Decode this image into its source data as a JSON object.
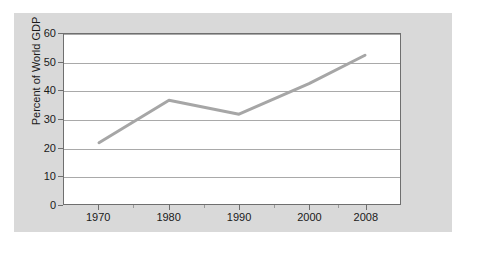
{
  "chart_data": {
    "type": "line",
    "title": "",
    "xlabel": "",
    "ylabel": "Percent of World GDP",
    "x": [
      1970,
      1980,
      1990,
      2000,
      2008
    ],
    "categories": [
      "1970",
      "1980",
      "1990",
      "2000",
      "2008"
    ],
    "values": [
      21.6,
      36.6,
      31.7,
      42.5,
      52.5
    ],
    "series": [
      {
        "name": "Percent of World GDP",
        "values": [
          21.6,
          36.6,
          31.7,
          42.5,
          52.5
        ]
      }
    ],
    "ylim": [
      0,
      60
    ],
    "xlim": [
      1965,
      2013
    ],
    "yticks": [
      0,
      10,
      20,
      30,
      40,
      50,
      60
    ],
    "ytick_labels": [
      "0",
      "10",
      "20",
      "30",
      "40",
      "50",
      "60"
    ],
    "xticks": [
      1970,
      1980,
      1990,
      2000,
      2008
    ],
    "xtick_labels": [
      "1970",
      "1980",
      "1990",
      "2000",
      "2008"
    ],
    "xminor_ticks": [
      1975,
      1985,
      1995,
      2004
    ],
    "grid": true,
    "grid_axis": "y",
    "legend": false,
    "legend_position": "none",
    "colors": {
      "line": "#a6a6a6",
      "grid": "#a9a9a9",
      "axis": "#6f6f6f",
      "plot_background": "#ffffff",
      "figure_background": "#d9d9d9",
      "text": "#1a1a1a"
    },
    "line_width": 3
  }
}
